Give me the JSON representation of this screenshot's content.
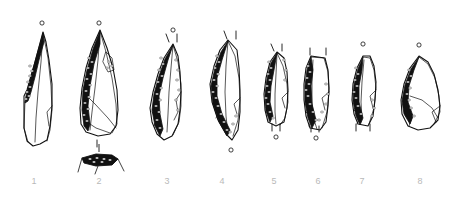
{
  "plate": {
    "kind": "lithic-illustration-plate",
    "background_color": "#ffffff",
    "ink_color": "#111111",
    "caption_color": "#b9b9b9",
    "caption_font_size_px": 9,
    "width": 454,
    "height": 202,
    "description": "Technical ink drawings of eight retouched stone blades and points, numbered 1 to 8"
  },
  "figures": [
    {
      "number": "1",
      "label_x": 34,
      "label_y": 183,
      "orientation_dot": "above",
      "dot_x": 42,
      "dot_y": 23,
      "tick_marks": [],
      "has_section_profile": false,
      "outline": "M 43,32 L 35,62 L 27,90 L 24,96 L 24,128 L 27,141 L 33,146 L 40,144 L 47,140 L 50,126 L 52,106 L 52,84 L 49,60 L 46,42 Z",
      "retouch_edge": "M 43,33 L 36,58 L 30,80 L 26,96 L 25,103 L 28,101 L 31,92 L 35,77 L 39,60 L 44,42 Z",
      "interior_lines": [
        "M 43,33 L 48,58 L 51,86 L 52,110 L 50,130 L 47,141",
        "M 43,33 L 41,62 L 38,92 L 36,118 L 35,142",
        "M 25,101 L 24,128 L 28,142",
        "M 52,106 L 47,112 L 49,126"
      ],
      "stipple": [
        [
          30,
          66
        ],
        [
          32,
          71
        ],
        [
          30,
          76
        ],
        [
          28,
          82
        ],
        [
          30,
          87
        ],
        [
          27,
          92
        ],
        [
          29,
          96
        ],
        [
          26,
          99
        ]
      ]
    },
    {
      "number": "2",
      "label_x": 99,
      "label_y": 183,
      "orientation_dot": "above",
      "dot_x": 99,
      "dot_y": 23,
      "tick_marks": [
        [
          97,
          140,
          97,
          147
        ]
      ],
      "has_section_profile": true,
      "outline": "M 100,30 L 92,48 L 86,68 L 82,88 L 80,108 L 81,124 L 86,132 L 98,136 L 110,134 L 116,126 L 118,110 L 117,90 L 113,68 L 107,48 Z",
      "retouch_edge": "M 100,31 L 93,49 L 87,70 L 83,90 L 82,110 L 84,126 L 88,131 L 90,124 L 88,106 L 90,86 L 94,64 L 100,44 Z",
      "interior_lines": [
        "M 100,31 L 106,52 L 112,78 L 116,104 L 117,124 L 112,133",
        "M 100,31 L 98,60 L 95,88 L 92,112 L 90,130",
        "M 83,92 L 95,104 L 108,118 L 116,128",
        "M 84,120 L 96,128 L 110,133",
        "M 106,52 L 112,58 L 114,70 L 108,72 L 103,62 Z"
      ],
      "stipple": [
        [
          89,
          58
        ],
        [
          92,
          62
        ],
        [
          88,
          68
        ],
        [
          91,
          74
        ],
        [
          87,
          79
        ],
        [
          90,
          85
        ],
        [
          86,
          91
        ],
        [
          89,
          97
        ],
        [
          85,
          103
        ],
        [
          88,
          109
        ],
        [
          84,
          115
        ],
        [
          87,
          121
        ],
        [
          109,
          62
        ],
        [
          112,
          66
        ],
        [
          107,
          68
        ]
      ],
      "section_profile": {
        "tick": [
          99,
          144,
          99,
          152
        ],
        "outline": "M 82,158 L 96,154 L 112,155 L 118,159 L 112,165 L 96,166 L 84,163 Z",
        "legs": [
          "M 82,158 L 78,172",
          "M 98,166 L 95,174",
          "M 118,159 L 124,171"
        ],
        "stipple": [
          [
            90,
            159
          ],
          [
            97,
            158
          ],
          [
            104,
            159
          ],
          [
            110,
            160
          ],
          [
            94,
            162
          ],
          [
            102,
            162
          ]
        ]
      }
    },
    {
      "number": "3",
      "label_x": 167,
      "label_y": 183,
      "orientation_dot": "above",
      "dot_x": 173,
      "dot_y": 30,
      "tick_marks": [
        [
          166,
          34,
          169,
          42
        ],
        [
          177,
          34,
          177,
          42
        ]
      ],
      "has_section_profile": false,
      "outline": "M 173,44 L 164,58 L 158,74 L 153,92 L 150,108 L 152,122 L 157,134 L 164,140 L 172,136 L 178,124 L 180,110 L 181,92 L 180,72 L 178,56 Z",
      "retouch_edge": "M 173,45 L 165,59 L 159,76 L 154,94 L 152,110 L 155,126 L 160,136 L 163,129 L 160,114 L 159,96 L 163,78 L 168,60 Z",
      "interior_lines": [
        "M 173,45 L 178,62 L 181,84 L 181,106 L 179,122 L 173,135",
        "M 173,45 L 171,68 L 169,92 L 168,114 L 167,132",
        "M 181,92 L 176,100 L 178,112 L 174,120",
        "M 152,112 L 157,118 L 154,126"
      ],
      "stipple": [
        [
          161,
          58
        ],
        [
          163,
          64
        ],
        [
          159,
          70
        ],
        [
          162,
          76
        ],
        [
          158,
          82
        ],
        [
          161,
          88
        ],
        [
          157,
          94
        ],
        [
          160,
          100
        ],
        [
          156,
          106
        ],
        [
          159,
          112
        ],
        [
          157,
          120
        ],
        [
          160,
          128
        ],
        [
          176,
          60
        ],
        [
          178,
          70
        ],
        [
          177,
          80
        ],
        [
          179,
          90
        ],
        [
          176,
          100
        ],
        [
          178,
          110
        ]
      ]
    },
    {
      "number": "4",
      "label_x": 222,
      "label_y": 183,
      "orientation_dot": "below",
      "dot_x": 231,
      "dot_y": 150,
      "tick_marks": [
        [
          224,
          31,
          227,
          39
        ],
        [
          236,
          31,
          236,
          39
        ]
      ],
      "has_section_profile": false,
      "outline": "M 228,40 L 220,50 L 214,66 L 210,84 L 212,102 L 218,120 L 226,134 L 232,140 L 238,130 L 240,112 L 240,90 L 239,68 L 237,50 Z",
      "retouch_edge": "M 228,41 L 221,52 L 215,68 L 211,86 L 213,104 L 219,122 L 227,136 L 230,130 L 222,114 L 217,96 L 217,78 L 222,60 Z",
      "interior_lines": [
        "M 228,41 L 235,56 L 239,78 L 240,100 L 238,120 L 233,136",
        "M 228,41 L 226,66 L 225,92 L 226,116 L 228,134",
        "M 240,98 L 234,104 L 237,114",
        "M 213,104 L 220,110 L 216,118"
      ],
      "stipple": [
        [
          217,
          56
        ],
        [
          219,
          62
        ],
        [
          215,
          68
        ],
        [
          218,
          74
        ],
        [
          214,
          80
        ],
        [
          217,
          86
        ],
        [
          213,
          92
        ],
        [
          216,
          98
        ],
        [
          218,
          106
        ],
        [
          221,
          114
        ],
        [
          224,
          122
        ],
        [
          227,
          130
        ],
        [
          236,
          116
        ],
        [
          233,
          124
        ],
        [
          230,
          132
        ]
      ]
    },
    {
      "number": "5",
      "label_x": 274,
      "label_y": 183,
      "orientation_dot": "below",
      "dot_x": 276,
      "dot_y": 137,
      "tick_marks": [
        [
          271,
          44,
          274,
          51
        ],
        [
          282,
          44,
          282,
          51
        ],
        [
          272,
          124,
          272,
          131
        ],
        [
          280,
          124,
          280,
          131
        ]
      ],
      "has_section_profile": false,
      "outline": "M 277,52 L 270,62 L 266,78 L 264,94 L 265,110 L 268,122 L 276,126 L 284,122 L 287,108 L 288,90 L 287,72 L 284,58 Z",
      "retouch_edge": "M 277,53 L 271,63 L 267,79 L 265,95 L 266,111 L 270,122 L 273,116 L 270,102 L 271,86 L 274,70 Z",
      "interior_lines": [
        "M 277,53 L 283,66 L 287,84 L 288,102 L 285,118 L 280,125",
        "M 277,53 L 276,74 L 275,94 L 275,112 L 276,124",
        "M 288,92 L 282,98 L 285,108",
        "M 266,108 L 272,114 L 269,120"
      ],
      "stipple": [
        [
          269,
          62
        ],
        [
          271,
          68
        ],
        [
          268,
          74
        ],
        [
          270,
          80
        ],
        [
          267,
          86
        ],
        [
          269,
          92
        ],
        [
          266,
          98
        ],
        [
          268,
          104
        ],
        [
          270,
          112
        ],
        [
          273,
          118
        ],
        [
          284,
          60
        ],
        [
          286,
          70
        ],
        [
          285,
          80
        ]
      ]
    },
    {
      "number": "6",
      "label_x": 318,
      "label_y": 183,
      "orientation_dot": "below",
      "dot_x": 316,
      "dot_y": 138,
      "tick_marks": [
        [
          310,
          48,
          310,
          55
        ],
        [
          326,
          48,
          326,
          55
        ],
        [
          311,
          126,
          311,
          132
        ],
        [
          319,
          126,
          319,
          132
        ]
      ],
      "has_section_profile": false,
      "outline": "M 311,56 L 306,68 L 304,84 L 304,100 L 306,116 L 310,128 L 320,130 L 326,122 L 328,106 L 329,88 L 328,70 L 325,58 Z",
      "retouch_edge": "M 311,57 L 307,70 L 305,86 L 305,102 L 308,118 L 312,128 L 316,120 L 312,104 L 311,86 L 313,70 Z",
      "interior_lines": [
        "M 311,57 L 324,58 L 328,72 L 329,92 L 327,112 L 322,128",
        "M 313,60 L 312,82 L 312,102 L 314,120 L 317,129",
        "M 329,92 L 322,98 L 325,110",
        "M 306,112 L 312,118 L 309,126"
      ],
      "stipple": [
        [
          308,
          66
        ],
        [
          310,
          72
        ],
        [
          307,
          78
        ],
        [
          309,
          84
        ],
        [
          306,
          90
        ],
        [
          308,
          96
        ],
        [
          310,
          104
        ],
        [
          313,
          112
        ],
        [
          316,
          120
        ],
        [
          326,
          84
        ],
        [
          328,
          94
        ],
        [
          326,
          104
        ],
        [
          322,
          112
        ],
        [
          319,
          120
        ]
      ]
    },
    {
      "number": "7",
      "label_x": 362,
      "label_y": 183,
      "orientation_dot": "above",
      "dot_x": 363,
      "dot_y": 44,
      "tick_marks": [
        [
          356,
          124,
          356,
          131
        ],
        [
          370,
          124,
          370,
          131
        ]
      ],
      "has_section_profile": false,
      "outline": "M 363,56 L 357,68 L 353,84 L 352,100 L 354,114 L 358,124 L 368,126 L 373,116 L 375,100 L 376,82 L 374,66 L 370,56 Z",
      "retouch_edge": "M 363,57 L 358,69 L 354,85 L 353,101 L 356,116 L 360,125 L 363,118 L 359,102 L 359,86 L 362,70 Z",
      "interior_lines": [
        "M 363,57 L 370,58 L 374,70 L 376,88 L 374,108 L 369,124",
        "M 364,60 L 362,82 L 361,102 L 362,118",
        "M 376,90 L 370,96 L 373,108",
        "M 354,110 L 360,116 L 357,124"
      ],
      "stipple": [
        [
          356,
          68
        ],
        [
          358,
          74
        ],
        [
          355,
          80
        ],
        [
          357,
          86
        ],
        [
          354,
          92
        ],
        [
          356,
          98
        ],
        [
          358,
          106
        ],
        [
          361,
          114
        ],
        [
          372,
          100
        ],
        [
          374,
          108
        ],
        [
          372,
          116
        ]
      ]
    },
    {
      "number": "8",
      "label_x": 420,
      "label_y": 183,
      "orientation_dot": "above",
      "dot_x": 419,
      "dot_y": 45,
      "tick_marks": [],
      "has_section_profile": false,
      "outline": "M 419,56 L 410,68 L 404,84 L 401,100 L 402,114 L 408,126 L 418,130 L 430,128 L 438,120 L 440,106 L 438,90 L 434,74 L 428,62 Z",
      "retouch_edge": "M 419,57 L 411,69 L 405,85 L 402,101 L 404,114 L 410,124 L 413,116 L 408,102 L 409,86 L 414,70 Z",
      "interior_lines": [
        "M 419,57 L 428,64 L 435,78 L 439,96 L 440,112 L 434,124",
        "M 410,96 L 422,100 L 432,108 L 438,118",
        "M 404,110 L 412,118 L 409,126",
        "M 440,106 L 432,112 L 436,122"
      ],
      "stipple": [
        [
          409,
          70
        ],
        [
          411,
          76
        ],
        [
          408,
          82
        ],
        [
          410,
          88
        ],
        [
          407,
          94
        ],
        [
          409,
          100
        ],
        [
          411,
          108
        ],
        [
          414,
          116
        ]
      ]
    }
  ]
}
